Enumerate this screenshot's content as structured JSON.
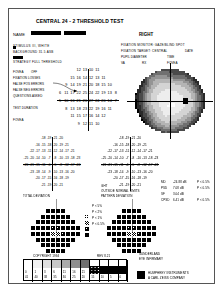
{
  "report": {
    "title": "CENTRAL 24 - 2 THRESHOLD TEST",
    "eye": "RIGHT",
    "name_label": "NAME",
    "name_value": "",
    "id_line": "",
    "dob_line": "",
    "blank_line": ""
  },
  "test_params": {
    "stimulus_label": "STIMULUS III, WHITE",
    "background_label": "BACKGROUND 31.5 ASB",
    "strategy_label": "STRATEGY FULL THRESHOLD",
    "pupil_label": "PUPIL DIAMETER",
    "va_label": "VA",
    "rx_label": "RX",
    "date_label": "DATE",
    "time_label": "TIME",
    "fovea_label": "FOVEA",
    "fixation_monitor_label": "FIXATION MONITOR: GAZE/BLIND SPOT",
    "fixation_target_label": "FIXATION TARGET: CENTRAL",
    "fixation_losses_label": "FIXATION LOSSES",
    "false_pos_label": "FALSE POS ERRORS",
    "false_neg_label": "FALSE NEG ERRORS",
    "questions_label": "QUESTIONS ASKED",
    "test_duration_label": "TEST DURATION",
    "fovea_result": "OFF"
  },
  "global_indices": {
    "md_label": "MD",
    "md_value": "-24.88 dB",
    "md_p": "P < 0.5%",
    "psd_label": "PSD",
    "psd_value": "7.08 dB",
    "psd_p": "P < 0.5%",
    "sf_label": "SF",
    "sf_value": "3.04 dB",
    "cpsd_label": "CPSD",
    "cpsd_value": "6.41 dB",
    "cpsd_p": "P < 0.5%"
  },
  "plots": {
    "total_dev_label": "TOTAL DEVIATION",
    "pattern_dev_label": "PATTERN DEVIATION",
    "ght_label": "GHT",
    "ght_value": "OUTSIDE NORMAL LIMITS"
  },
  "probability_legend": {
    "title": "PROBABILITY SYMBOLS",
    "items": [
      {
        "symbol": "p5",
        "label": "P < 5%"
      },
      {
        "symbol": "p2",
        "label": "P < 2%"
      },
      {
        "symbol": "p1",
        "label": "P < 1%"
      },
      {
        "symbol": "p05",
        "label": "P < 0.5%"
      }
    ]
  },
  "footer": {
    "copyright": "COPYRIGHT 1994",
    "revision": "REV 8.21",
    "sunderland": "SUNDERLAND",
    "eye_dept": "EYE INFIRMARY",
    "brand_line1": "HUMPHREY INSTRUMENTS",
    "brand_line2": "A CARL ZEISS COMPANY"
  },
  "gray_scale": {
    "db_row": [
      "0",
      "1",
      "3",
      "6",
      "11",
      "16",
      "21",
      "26",
      "31",
      "36",
      "41"
    ],
    "asb_row": [
      "41",
      "40",
      "38",
      "35",
      "30",
      "25",
      "20",
      "15",
      "10",
      "5",
      "0"
    ],
    "bottom_row": [
      "<0",
      "<1",
      "<3",
      "<6",
      "<11",
      "<16",
      "<21",
      "<26",
      "<31",
      "<36",
      "<41"
    ]
  },
  "chart_data": {
    "type": "table",
    "threshold_grid": [
      [
        null,
        null,
        null,
        "12",
        "13",
        "10",
        "11",
        null,
        null,
        null
      ],
      [
        null,
        null,
        "15",
        "16",
        "14",
        "12",
        "13",
        "11",
        null,
        null
      ],
      [
        null,
        "9",
        "14",
        "19",
        "21",
        "20",
        "18",
        "15",
        "10",
        null
      ],
      [
        "6",
        "11",
        "17",
        "22",
        "25",
        "24",
        "22",
        "19",
        "13",
        "8"
      ],
      [
        "5",
        "10",
        "16",
        "21",
        "26",
        "27",
        "24",
        "20",
        "14",
        "7"
      ],
      [
        null,
        "8",
        "13",
        "18",
        "23",
        "22",
        "19",
        "16",
        "11",
        null
      ],
      [
        null,
        null,
        "11",
        "15",
        "17",
        "16",
        "14",
        "12",
        null,
        null
      ],
      [
        null,
        null,
        null,
        "9",
        "12",
        "11",
        "10",
        null,
        null,
        null
      ]
    ],
    "total_deviation": [
      [
        null,
        null,
        null,
        "-18",
        "-19",
        "-21",
        "-20",
        null,
        null,
        null
      ],
      [
        null,
        null,
        "-16",
        "-15",
        "-18",
        "-20",
        "-19",
        "-21",
        null,
        null
      ],
      [
        null,
        "-22",
        "-17",
        "-13",
        "-11",
        "-12",
        "-14",
        "-17",
        "-21",
        null
      ],
      [
        "-25",
        "-20",
        "-14",
        "-10",
        "-7",
        "-8",
        "-10",
        "-13",
        "-18",
        "-23"
      ],
      [
        "-26",
        "-21",
        "-15",
        "-11",
        "-6",
        "-5",
        "-8",
        "-12",
        "-17",
        "-24"
      ],
      [
        null,
        "-23",
        "-18",
        "-14",
        "-9",
        "-10",
        "-13",
        "-16",
        "-20",
        null
      ],
      [
        null,
        null,
        "-20",
        "-17",
        "-15",
        "-16",
        "-18",
        "-19",
        null,
        null
      ],
      [
        null,
        null,
        null,
        "-21",
        "-19",
        "-20",
        "-21",
        null,
        null,
        null
      ]
    ],
    "pattern_deviation_symbols": [
      [
        null,
        null,
        null,
        "p05",
        "p05",
        "p05",
        "p05",
        null,
        null,
        null
      ],
      [
        null,
        null,
        "p05",
        "p05",
        "p05",
        "p05",
        "p05",
        "p05",
        null,
        null
      ],
      [
        null,
        "p05",
        "p05",
        "p05",
        "p05",
        "p05",
        "p05",
        "p05",
        "p05",
        null
      ],
      [
        "p05",
        "p05",
        "p05",
        "p05",
        "p1",
        "p1",
        "p05",
        "p05",
        "p05",
        "p05"
      ],
      [
        "p05",
        "p05",
        "p05",
        "p05",
        "p2",
        "p2",
        "p1",
        "p05",
        "p05",
        "p05"
      ],
      [
        null,
        "p05",
        "p05",
        "p05",
        "p05",
        "p05",
        "p05",
        "p05",
        "p05",
        null
      ],
      [
        null,
        null,
        "p05",
        "p05",
        "p05",
        "p05",
        "p05",
        "p05",
        null,
        null
      ],
      [
        null,
        null,
        null,
        "p05",
        "p05",
        "p05",
        "p05",
        null,
        null,
        null
      ]
    ]
  }
}
